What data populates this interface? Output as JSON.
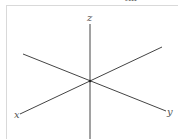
{
  "figure": {
    "top_clipped_text": "ℓm",
    "axes": {
      "z": {
        "label": "z"
      },
      "x": {
        "label": "x"
      },
      "y": {
        "label": "y"
      }
    },
    "colors": {
      "axis": "#444444",
      "frame": "#d9d9d9",
      "label": "#555555"
    }
  }
}
